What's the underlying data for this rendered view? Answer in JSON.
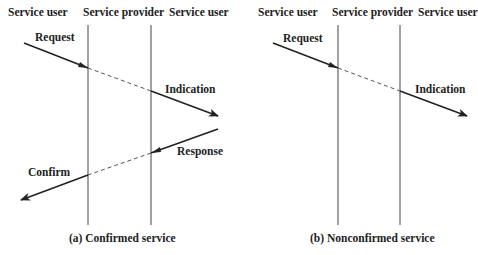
{
  "diagrams": [
    {
      "id": "a",
      "caption": "(a) Confirmed service",
      "columns": [
        "Service user",
        "Service provider",
        "Service user"
      ],
      "primitives": [
        "Request",
        "Indication",
        "Response",
        "Confirm"
      ]
    },
    {
      "id": "b",
      "caption": "(b) Nonconfirmed service",
      "columns": [
        "Service user",
        "Service provider",
        "Service user"
      ],
      "primitives": [
        "Request",
        "Indication"
      ]
    }
  ],
  "colors": {
    "line": "#222222",
    "background": "#ffffff"
  }
}
